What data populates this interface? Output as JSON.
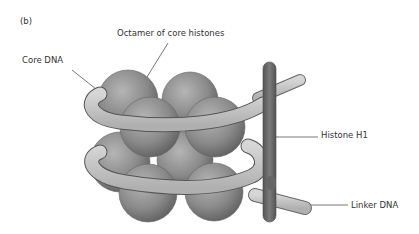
{
  "panel_label": "(b)",
  "labels": {
    "octamer": "Octamer of core histones",
    "core_dna": "Core DNA",
    "histone_h1": "Histone H1",
    "linker_dna": "Linker DNA"
  },
  "colors": {
    "background": "#ffffff",
    "histone_sphere": "#8a8a8a",
    "dna_tube": "#c4c4c4",
    "h1_rod": "#6a6a6a",
    "leader_line": "#555555",
    "text": "#333333"
  }
}
